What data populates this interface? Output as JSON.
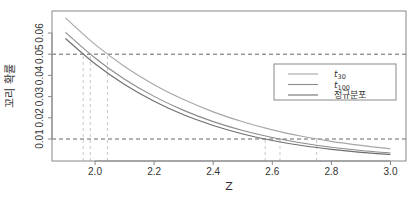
{
  "chart_data": {
    "type": "line",
    "title": "",
    "xlabel": "Z",
    "ylabel": "꼬리 확률",
    "xlim": [
      1.9,
      3.0
    ],
    "ylim": [
      0.0,
      0.067
    ],
    "x_ticks": [
      "2.0",
      "2.2",
      "2.4",
      "2.6",
      "2.8",
      "3.0"
    ],
    "y_ticks": [
      "0.01",
      "0.02",
      "0.03",
      "0.04",
      "0.05",
      "0.06"
    ],
    "grid": false,
    "legend_position": "upper-right-inset",
    "x": [
      1.9,
      2.0,
      2.1,
      2.2,
      2.3,
      2.4,
      2.5,
      2.6,
      2.7,
      2.8,
      2.9,
      3.0
    ],
    "series": [
      {
        "name": "t30",
        "label_base": "t",
        "label_sub": "30",
        "color": "#a6a6a6",
        "values": [
          0.0671,
          0.0546,
          0.0442,
          0.0356,
          0.0286,
          0.0228,
          0.0181,
          0.0143,
          0.0113,
          0.0089,
          0.007,
          0.0054
        ]
      },
      {
        "name": "t100",
        "label_base": "t",
        "label_sub": "100",
        "color": "#8c8c8c",
        "values": [
          0.0603,
          0.0482,
          0.0382,
          0.0301,
          0.0235,
          0.0182,
          0.014,
          0.0107,
          0.0081,
          0.0061,
          0.0046,
          0.0034
        ]
      },
      {
        "name": "정규분포",
        "label_base": "정규분포",
        "label_sub": "",
        "color": "#6e6e6e",
        "values": [
          0.0574,
          0.0455,
          0.0357,
          0.0278,
          0.0214,
          0.0164,
          0.0124,
          0.0093,
          0.0069,
          0.0051,
          0.0037,
          0.0027
        ]
      }
    ],
    "hlines": [
      0.05,
      0.01
    ],
    "vlines": [
      1.96,
      1.984,
      2.042,
      2.576,
      2.626,
      2.75
    ],
    "annotations": []
  }
}
